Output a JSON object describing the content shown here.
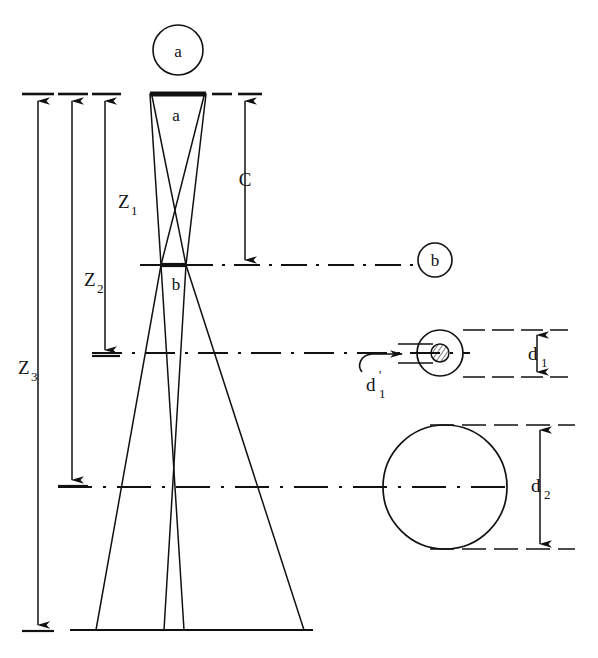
{
  "figure": {
    "background_color": "#ffffff",
    "line_color": "#111111",
    "labels": {
      "circle_a": "a",
      "circle_b": "b",
      "source_bar": "a",
      "waist_bar": "b",
      "dim_c": "C",
      "dim_z1_base": "Z",
      "dim_z1_sub": "1",
      "dim_z2_base": "Z",
      "dim_z2_sub": "2",
      "dim_z3_base": "Z",
      "dim_z3_sub": "3",
      "dim_d1_base": "d",
      "dim_d1_sub": "1",
      "dim_d1p_base": "d",
      "dim_d1p_prime": "'",
      "dim_d1p_sub": "1",
      "dim_d2_base": "d",
      "dim_d2_sub": "2"
    }
  },
  "geometry": {
    "circle_a_marker": {
      "cx": 178,
      "cy": 50,
      "r": 25
    },
    "circle_b_marker": {
      "cx": 435,
      "cy": 260,
      "r": 17
    },
    "source_bar": {
      "x1": 150,
      "x2": 206,
      "y": 94
    },
    "waist_bar": {
      "x1": 161,
      "x2": 186,
      "y": 265
    },
    "baseline": {
      "x1": 70,
      "x2": 313,
      "y": 630
    },
    "dim_lines_x": {
      "z3": 38,
      "z2": 72,
      "z1": 105,
      "c": 245
    },
    "dim_spans": {
      "z1": [
        94,
        355
      ],
      "z2": [
        94,
        485
      ],
      "z3": [
        94,
        630
      ],
      "c": [
        94,
        265
      ]
    },
    "axis_levels": [
      265,
      353,
      487
    ],
    "spot_d1": {
      "cx": 440,
      "cy": 353,
      "r": 23,
      "core_r": 9
    },
    "spot_d2": {
      "cx": 445,
      "cy": 487,
      "r": 62
    },
    "d1_dim_x": 537,
    "d2_dim_x": 540,
    "d1_dim_span": [
      330,
      377
    ],
    "d2_dim_span": [
      425,
      549
    ]
  },
  "elements": {
    "source_aperture": "source-aperture-bar",
    "waist_aperture": "beam-waist-bar",
    "beam_outline": "beam-ray-outline",
    "ground_line": "detector-plane-line",
    "spot_small": "small-beam-spot",
    "spot_core": "hatched-core-spot",
    "spot_large": "large-beam-spot"
  }
}
